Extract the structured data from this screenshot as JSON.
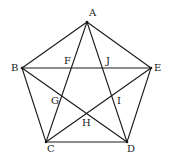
{
  "diagram": {
    "type": "regular pentagon with all diagonals (pentagram)",
    "stroke_color": "#1a1a1a",
    "vertices": {
      "A": [
        87,
        22
      ],
      "B": [
        22,
        68
      ],
      "C": [
        46,
        142
      ],
      "D": [
        127,
        142
      ],
      "E": [
        151,
        68
      ]
    },
    "sides": [
      [
        "A",
        "B"
      ],
      [
        "B",
        "C"
      ],
      [
        "C",
        "D"
      ],
      [
        "D",
        "E"
      ],
      [
        "E",
        "A"
      ]
    ],
    "diagonals": [
      [
        "A",
        "C"
      ],
      [
        "A",
        "D"
      ],
      [
        "B",
        "D"
      ],
      [
        "B",
        "E"
      ],
      [
        "C",
        "E"
      ]
    ],
    "labels": [
      {
        "id": "A",
        "text": "A",
        "x": 89,
        "y": 8
      },
      {
        "id": "B",
        "text": "B",
        "x": 11,
        "y": 63
      },
      {
        "id": "E",
        "text": "E",
        "x": 154,
        "y": 63
      },
      {
        "id": "C",
        "text": "C",
        "x": 47,
        "y": 144
      },
      {
        "id": "D",
        "text": "D",
        "x": 127,
        "y": 144
      },
      {
        "id": "F",
        "text": "F",
        "x": 64,
        "y": 56
      },
      {
        "id": "J",
        "text": "J",
        "x": 106,
        "y": 56
      },
      {
        "id": "G",
        "text": "G",
        "x": 51,
        "y": 96
      },
      {
        "id": "I",
        "text": "I",
        "x": 117,
        "y": 96
      },
      {
        "id": "H",
        "text": "H",
        "x": 82,
        "y": 118
      }
    ]
  }
}
